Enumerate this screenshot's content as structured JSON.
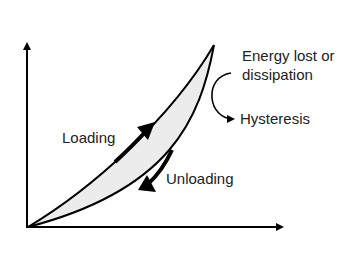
{
  "diagram": {
    "type": "hysteresis-loop",
    "labels": {
      "loading": "Loading",
      "unloading": "Unloading",
      "energy_line1": "Energy lost or",
      "energy_line2": "dissipation",
      "hysteresis": "Hysteresis"
    },
    "colors": {
      "stroke": "#000000",
      "loop_fill": "#ececec",
      "text": "#222222",
      "background": "#ffffff"
    }
  }
}
